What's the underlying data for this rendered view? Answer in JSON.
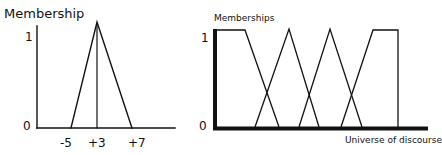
{
  "left_chart": {
    "ylabel": "Membership",
    "y_ticks": [
      "1",
      "0"
    ],
    "x_ticks": [
      "-5",
      "+3",
      "+7"
    ],
    "membership_function": {
      "type": "triangular",
      "points": [
        [
          -5,
          0
        ],
        [
          3,
          1
        ],
        [
          7,
          0
        ]
      ]
    }
  },
  "right_chart": {
    "ylabel": "Memberships",
    "y_ticks": [
      "1",
      "0"
    ],
    "xlabel": "Universe of discourse",
    "membership_functions": [
      {
        "name": "set-1",
        "type": "trapezoidal-left-shoulder"
      },
      {
        "name": "set-2",
        "type": "triangular"
      },
      {
        "name": "set-3",
        "type": "triangular"
      },
      {
        "name": "set-4",
        "type": "trapezoidal-right-shoulder"
      }
    ]
  },
  "colors": {
    "line": "#111111",
    "background": "#ffffff"
  }
}
